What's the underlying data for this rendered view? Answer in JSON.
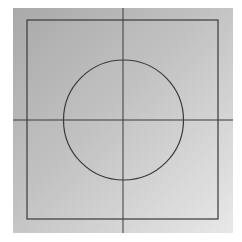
{
  "diagram": {
    "colors": {
      "background_start": "#a9a9a9",
      "background_end": "#e8e8e8",
      "stroke": "#3a3a3a"
    },
    "canvas": {
      "x": 13,
      "y": 8,
      "width": 220,
      "height": 225
    },
    "rectangle": {
      "x": 27,
      "y": 20,
      "width": 191,
      "height": 199
    },
    "circle": {
      "cx": 123.5,
      "cy": 120,
      "r": 60
    },
    "vertical_line": {
      "x": 123,
      "y1": 8,
      "y2": 233
    },
    "horizontal_line": {
      "y": 120,
      "x1": 13,
      "x2": 233
    }
  }
}
